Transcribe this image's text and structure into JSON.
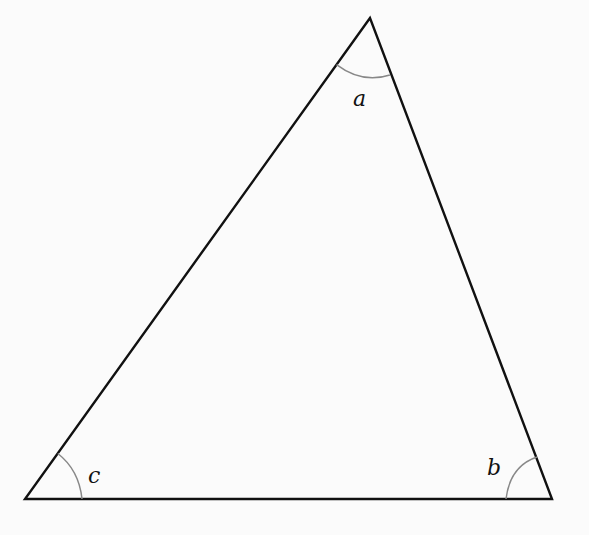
{
  "diagram": {
    "type": "triangle",
    "vertices": {
      "top": {
        "x": 370,
        "y": 18
      },
      "bottom_left": {
        "x": 25,
        "y": 499
      },
      "bottom_right": {
        "x": 552,
        "y": 499
      }
    },
    "angles": [
      {
        "name": "a",
        "label": "a",
        "vertex": "top"
      },
      {
        "name": "b",
        "label": "b",
        "vertex": "bottom_right"
      },
      {
        "name": "c",
        "label": "c",
        "vertex": "bottom_left"
      }
    ],
    "colors": {
      "edge": "#111111",
      "arc": "#888888",
      "label": "#111111"
    }
  }
}
